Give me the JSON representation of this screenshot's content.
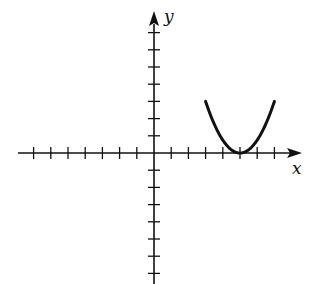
{
  "chart_data": {
    "type": "line",
    "title": "",
    "xlabel": "x",
    "ylabel": "y",
    "xlim": [
      -7,
      7
    ],
    "ylim": [
      -7,
      7
    ],
    "grid": false,
    "tick_labels": false,
    "x_ticks": [
      -7,
      -6,
      -5,
      -4,
      -3,
      -2,
      -1,
      1,
      2,
      3,
      4,
      5,
      6,
      7
    ],
    "y_ticks": [
      -7,
      -6,
      -5,
      -4,
      -3,
      -2,
      -1,
      1,
      2,
      3,
      4,
      5,
      6,
      7
    ],
    "series": [
      {
        "name": "parabola",
        "equation": "y = 0.75(x - 5)^2",
        "vertex": [
          5,
          0
        ],
        "domain": [
          3,
          7
        ],
        "x": [
          3,
          3.5,
          4,
          4.5,
          5,
          5.5,
          6,
          6.5,
          7
        ],
        "y": [
          3,
          1.6875,
          0.75,
          0.1875,
          0,
          0.1875,
          0.75,
          1.6875,
          3
        ]
      }
    ],
    "legend": null
  },
  "labels": {
    "x_axis": "x",
    "y_axis": "y"
  },
  "colors": {
    "axis": "#111111",
    "curve": "#111111",
    "background": "#ffffff"
  }
}
